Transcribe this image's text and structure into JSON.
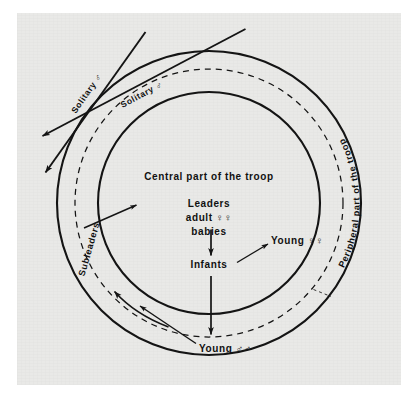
{
  "figure": {
    "kind": "concentric-zone-diagram",
    "background_color": "#ffffff",
    "plate_color": "#e9e9e7",
    "ink_color": "#141414"
  },
  "rings": {
    "center": {
      "x": 209,
      "y": 203
    },
    "outer_radius": 152,
    "dashed_radius": 134,
    "middle_radius": 111,
    "outer_style": "solid",
    "dashed_style": "dashed",
    "middle_style": "solid"
  },
  "labels": {
    "center_zone": "Central part of the troop",
    "leaders": "Leaders",
    "adult_females": "adult ♀♀",
    "babies": "babies",
    "infants": "Infants",
    "young_females": "Young ♀♀",
    "young_males": "Young ♂♂",
    "subleaders": "Subleaders",
    "peripheral_zone": "Peripheral part of the troop",
    "solitary_male_outer": "Solitary ♂",
    "solitary_male_inner": "Solitary ♂"
  },
  "symbols": {
    "female": "♀",
    "male": "♂"
  },
  "annotations": [
    {
      "name": "subleaders-pointer",
      "kind": "straight-arrow",
      "direction": "up-right"
    },
    {
      "name": "young-females-pointer",
      "kind": "straight-arrow",
      "direction": "up-right"
    },
    {
      "name": "young-males-pointer",
      "kind": "straight-arrow",
      "direction": "up-left"
    },
    {
      "name": "babies-to-infants-arrow",
      "kind": "straight-arrow",
      "direction": "down"
    },
    {
      "name": "infants-outward-arrow",
      "kind": "straight-arrow",
      "direction": "down"
    },
    {
      "name": "ring-flow-arrow",
      "kind": "curved-arrow",
      "direction": "counterclockwise"
    },
    {
      "name": "solitary-male-path-outer",
      "kind": "straight-arrow",
      "direction": "down-left"
    },
    {
      "name": "solitary-male-path-inner",
      "kind": "straight-arrow",
      "direction": "down-left"
    }
  ]
}
